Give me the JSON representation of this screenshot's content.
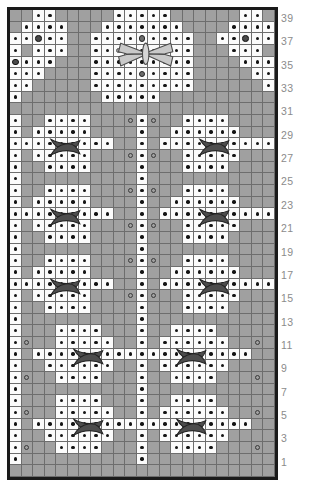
{
  "chart_data": {
    "type": "heatmap",
    "title": "",
    "xlabel": "",
    "ylabel": "",
    "columns": 23,
    "rows": 40,
    "row_labels": [
      "39",
      "37",
      "35",
      "33",
      "31",
      "29",
      "27",
      "25",
      "23",
      "21",
      "19",
      "17",
      "15",
      "13",
      "11",
      "9",
      "7",
      "5",
      "3",
      "1"
    ],
    "legend": [],
    "symbols": {
      "w": "white-background-cell",
      "g": "grey-background-cell",
      "dot": "purl-dot",
      "ring": "yarn-over-open-circle",
      "bob": "bobble-grey-circle",
      "bobd": "bobble-dark-circle",
      "sring": "small-grey-ring",
      "x": "cable-cross",
      "butterfly": "butterfly-motif"
    },
    "grid": [
      "g g w.dot w.dot g g g g g w.dot w.dot w.dot w.dot w.dot g g g g g g w.dot w.dot g",
      "g w.dot w.dot w.dot w.dot g g g w.dot w.dot w.dot w.dot w.dot w.dot w.dot g g g g w.dot w.dot w.dot w.dot",
      "w.dot w.dot w.bobd w.dot w.dot g g w.dot w.dot w.dot w.dot w.bob w.dot w.dot w.dot w.dot g g w.dot w.dot w.bobd w.dot w.dot",
      "w.dot g w.dot w.dot w.dot g g w.dot w.dot w.sring w.dot w.dot w.dot w.sring w.dot w.dot g g g w.dot w.dot w.dot g",
      "w.bobd w.dot w.dot w.dot g g g w.dot w.dot w.dot w.dot w.dot w.dot w.dot w.dot w.dot g g g g w.dot w.dot w.dot",
      "w.dot w.dot w.dot g g g g w.dot w.dot w.dot w.dot w.bob w.dot w.dot w.dot w.dot g g g g g w.dot w.dot",
      "w.dot w.dot g g g g g w.dot w.dot w.dot w.dot w.dot w.dot w.dot w.dot w.dot g g g g g g w.dot",
      "w.dot g g g g g g g w.dot w.dot w.dot w.dot w.dot g g g g g g g g g g",
      "g g g g g g g g g g g g g g g g g g g g g g g",
      "w.dot g g w.dot w.dot w.dot w.dot g g g g.ring w.dot g.ring g g w.dot w.dot w.dot w.dot g g g",
      "w.dot g w.dot w.dot w.dot w.dot w.dot g g g g w.dot g g w.dot w.dot w.dot w.dot w.dot w.dot g g g",
      "w.dot w.dot w.dot w.dot w.dot w.dot w.dot w.dot w.dot g g w.dot g w.dot w.dot w.dot w.dot w.dot w.dot w.dot w.dot w.dot w.dot",
      "w.dot g w.dot w.dot w.dot w.dot w.dot g g g g.ring w.dot g.ring g g w.dot w.dot w.dot w.dot w.dot g g",
      "w.dot g g w.dot w.dot w.dot w.dot g g g g w.dot g g g w.dot w.dot w.dot w.dot g g g g",
      "w.dot g g g g g g g g g g w.dot g g g g g g g g g g g",
      "w.dot g g w.dot w.dot w.dot w.dot g g g g.ring w.dot g.ring g g w.dot w.dot w.dot w.dot g g g",
      "w.dot g w.dot w.dot w.dot w.dot w.dot g g g g w.dot g g w.dot w.dot w.dot w.dot w.dot w.dot g g g",
      "w.dot w.dot w.dot w.dot w.dot w.dot w.dot w.dot w.dot g g w.dot g w.dot w.dot w.dot w.dot w.dot w.dot w.dot w.dot w.dot w.dot",
      "w.dot g w.dot w.dot w.dot w.dot w.dot g g g g.ring w.dot g.ring g g w.dot w.dot w.dot w.dot w.dot g g",
      "w.dot g g w.dot w.dot w.dot w.dot g g g g w.dot g g g w.dot w.dot w.dot w.dot g g g g",
      "w.dot g g g g g g g g g g w.dot g g g g g g g g g g g",
      "w.dot g g w.dot w.dot w.dot w.dot g g g g.ring w.dot g.ring g g w.dot w.dot w.dot w.dot g g g",
      "w.dot g w.dot w.dot w.dot w.dot w.dot g g g g w.dot g g w.dot w.dot w.dot w.dot w.dot w.dot g g g",
      "w.dot w.dot w.dot w.dot w.dot w.dot w.dot w.dot w.dot g g w.dot g w.dot w.dot w.dot w.dot w.dot w.dot w.dot w.dot w.dot w.dot",
      "w.dot g w.dot w.dot w.dot w.dot w.dot g g g g.ring w.dot g.ring g g w.dot w.dot w.dot w.dot w.dot g g",
      "w.dot g g w.dot w.dot w.dot w.dot g g g g w.dot g g g w.dot w.dot w.dot w.dot g g g g",
      "w.dot g g g g g g g g g g w.dot g g g g g g g g g g g",
      "w.dot g g g w.dot w.dot w.dot w.dot g g g w.dot g g w.dot w.dot w.dot w.dot g g g g",
      "w.dot g.ring g g w.dot w.dot w.dot w.dot w.dot g g w.dot g w.dot w.dot w.dot w.dot w.dot w.dot g g g.ring",
      "w.dot g w.dot w.dot w.dot w.dot w.dot w.dot w.dot w.dot w.dot w.dot w.dot w.dot w.dot w.dot w.dot w.dot w.dot w.dot w.dot g g",
      "w.dot g g w.dot w.dot w.dot w.dot w.dot w.dot g g w.dot g w.dot w.dot w.dot w.dot w.dot w.dot g g g",
      "w.dot g.ring g g w.dot w.dot w.dot w.dot g g g w.dot g g w.dot w.dot w.dot w.dot g g g g.ring",
      "w.dot g g g g g g g g g g w.dot g g g g g g g g g g g",
      "w.dot g g g w.dot w.dot w.dot w.dot g g g w.dot g g w.dot w.dot w.dot w.dot g g g g",
      "w.dot g.ring g g w.dot w.dot w.dot w.dot w.dot g g w.dot g w.dot w.dot w.dot w.dot w.dot w.dot g g g.ring",
      "w.dot g w.dot w.dot w.dot w.dot w.dot w.dot w.dot w.dot w.dot w.dot w.dot w.dot w.dot w.dot w.dot w.dot w.dot w.dot w.dot g g",
      "w.dot g g w.dot w.dot w.dot w.dot w.dot w.dot g g w.dot g w.dot w.dot w.dot w.dot w.dot w.dot g g g",
      "w.dot g.ring g g w.dot w.dot w.dot w.dot g g g w.dot g g w.dot w.dot w.dot w.dot g g g g.ring",
      "w.dot g g g g g g g g g g w.dot g g g g g g g g g g g",
      "g g g g g g g g g g g g g g g g g g g g g g g"
    ],
    "crosses": [
      {
        "row": 11,
        "col": 4
      },
      {
        "row": 11,
        "col": 17
      },
      {
        "row": 17,
        "col": 4
      },
      {
        "row": 17,
        "col": 17
      },
      {
        "row": 23,
        "col": 4
      },
      {
        "row": 23,
        "col": 17
      },
      {
        "row": 29,
        "col": 6
      },
      {
        "row": 29,
        "col": 15
      },
      {
        "row": 35,
        "col": 6
      },
      {
        "row": 35,
        "col": 15
      }
    ],
    "butterflies": [
      {
        "row": 3,
        "col": 11
      }
    ]
  }
}
